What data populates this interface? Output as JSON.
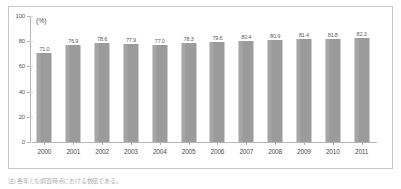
{
  "chart_data": {
    "type": "bar",
    "title": "",
    "subtitle": "",
    "xlabel": "",
    "ylabel": "",
    "unit_label": "(%)",
    "ylim": [
      0,
      100
    ],
    "yticks": [
      0,
      20,
      40,
      60,
      80,
      100
    ],
    "grid": false,
    "legend": "none",
    "categories": [
      "2000",
      "2001",
      "2002",
      "2003",
      "2004",
      "2005",
      "2006",
      "2007",
      "2008",
      "2009",
      "2010",
      "2011"
    ],
    "values": [
      71.0,
      76.9,
      78.6,
      77.9,
      77.0,
      78.3,
      79.6,
      80.4,
      80.9,
      81.4,
      81.8,
      82.3
    ],
    "value_labels": [
      "71.0",
      "76.9",
      "78.6",
      "77.9",
      "77.0",
      "78.3",
      "79.6",
      "80.4",
      "80.9",
      "81.4",
      "81.8",
      "82.3"
    ],
    "bar_color": "#9b9b9b",
    "axis_color": "#b4b4b4",
    "text_color": "#58585a"
  },
  "footnote": {
    "text": "注) 各年とも調査時点における数値である。"
  }
}
